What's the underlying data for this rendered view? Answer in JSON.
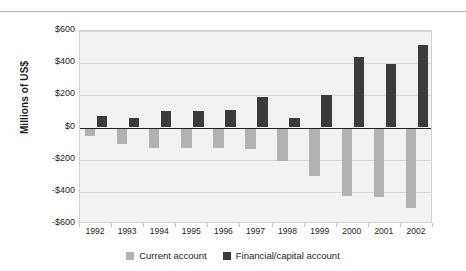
{
  "chart_data": {
    "type": "bar",
    "title": "",
    "subtitle": "",
    "xlabel": "",
    "ylabel": "Millions of US$",
    "categories": [
      "1992",
      "1993",
      "1994",
      "1995",
      "1996",
      "1997",
      "1998",
      "1999",
      "2000",
      "2001",
      "2002"
    ],
    "series": [
      {
        "name": "Current account",
        "color": "#b2b2b2",
        "values": [
          -50,
          -105,
          -130,
          -125,
          -125,
          -135,
          -210,
          -300,
          -425,
          -430,
          -500
        ]
      },
      {
        "name": "Financial/capital account",
        "color": "#3b3b3d",
        "values": [
          70,
          60,
          105,
          100,
          110,
          190,
          60,
          205,
          440,
          395,
          510
        ]
      }
    ],
    "ylim": [
      -600,
      600
    ],
    "ytick_values": [
      600,
      400,
      200,
      0,
      -200,
      -400,
      -600
    ],
    "ytick_labels": [
      "$600",
      "$400",
      "$200",
      "$0",
      "-$200",
      "-$400",
      "-$600"
    ],
    "grid": true,
    "legend_position": "bottom",
    "plot_background": "#f2f2f2",
    "zero_line_color": "#231f20"
  },
  "legend": {
    "items": [
      {
        "label": "Current account",
        "color": "#b2b2b2"
      },
      {
        "label": "Financial/capital account",
        "color": "#3b3b3d"
      }
    ]
  }
}
